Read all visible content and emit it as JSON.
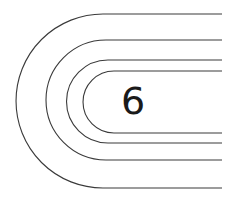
{
  "diagram": {
    "type": "running-track-lanes",
    "lane_count": 4,
    "lane_label": "6",
    "stroke_color": "#3a3a3a",
    "text_color": "#1a1a1a",
    "background": "#ffffff"
  }
}
